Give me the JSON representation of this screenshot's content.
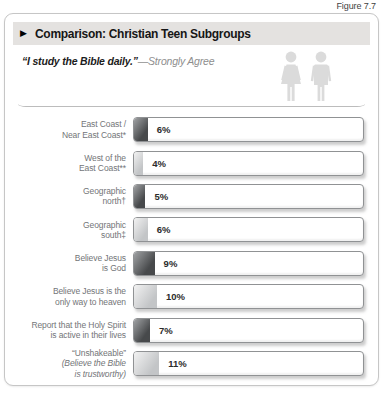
{
  "figure_label": "Figure 7.7",
  "panel": {
    "header": {
      "bullet": "▶",
      "title": "Comparison: Christian Teen Subgroups"
    },
    "subtitle": {
      "quote": "“I study the Bible daily.”",
      "qualifier_with_dash": "—Strongly Agree"
    },
    "people_icon": "female-male-couple-icon",
    "icon_color": "#dbdbdb"
  },
  "colors": {
    "header_strip": "#e4e2e0",
    "bar_fill_dark": "#4d4f52",
    "bar_fill_light": "#c8cacc",
    "bar_border": "#909294",
    "label_text": "#737578",
    "value_text": "#2b2b2b"
  },
  "chart_data": {
    "type": "bar",
    "orientation": "horizontal",
    "title": "Comparison: Christian Teen Subgroups",
    "subtitle": "“I study the Bible daily.” — Strongly Agree",
    "xlim": [
      0,
      100
    ],
    "value_suffix": "%",
    "grid": false,
    "legend": false,
    "categories": [
      "East Coast / Near East Coast*",
      "West of the East Coast**",
      "Geographic north†",
      "Geographic south‡",
      "Believe Jesus is God",
      "Believe Jesus is the only way to heaven",
      "Report that the Holy Spirit is active in their lives",
      "“Unshakeable” (Believe the Bible is trustworthy)"
    ],
    "values": [
      6,
      4,
      5,
      6,
      9,
      10,
      7,
      11
    ],
    "rows": [
      {
        "lines": [
          {
            "text": "East Coast /",
            "italic": false
          },
          {
            "text": "Near East Coast*",
            "italic": false
          }
        ],
        "value": 6,
        "display": "6%",
        "tone": "dark"
      },
      {
        "lines": [
          {
            "text": "West of the",
            "italic": false
          },
          {
            "text": "East Coast**",
            "italic": false
          }
        ],
        "value": 4,
        "display": "4%",
        "tone": "light"
      },
      {
        "lines": [
          {
            "text": "Geographic",
            "italic": false
          },
          {
            "text": "north†",
            "italic": false
          }
        ],
        "value": 5,
        "display": "5%",
        "tone": "dark"
      },
      {
        "lines": [
          {
            "text": "Geographic",
            "italic": false
          },
          {
            "text": "south‡",
            "italic": false
          }
        ],
        "value": 6,
        "display": "6%",
        "tone": "light"
      },
      {
        "lines": [
          {
            "text": "Believe Jesus",
            "italic": false
          },
          {
            "text": "is God",
            "italic": false
          }
        ],
        "value": 9,
        "display": "9%",
        "tone": "dark"
      },
      {
        "lines": [
          {
            "text": "Believe Jesus is the",
            "italic": false
          },
          {
            "text": "only way to heaven",
            "italic": false
          }
        ],
        "value": 10,
        "display": "10%",
        "tone": "light"
      },
      {
        "lines": [
          {
            "text": "Report that the Holy Spirit",
            "italic": false
          },
          {
            "text": "is active in their lives",
            "italic": false
          }
        ],
        "value": 7,
        "display": "7%",
        "tone": "dark"
      },
      {
        "lines": [
          {
            "text": "“Unshakeable”",
            "italic": false
          },
          {
            "text": "(Believe the Bible",
            "italic": true
          },
          {
            "text": "is trustworthy)",
            "italic": true
          }
        ],
        "value": 11,
        "display": "11%",
        "tone": "light"
      }
    ]
  }
}
